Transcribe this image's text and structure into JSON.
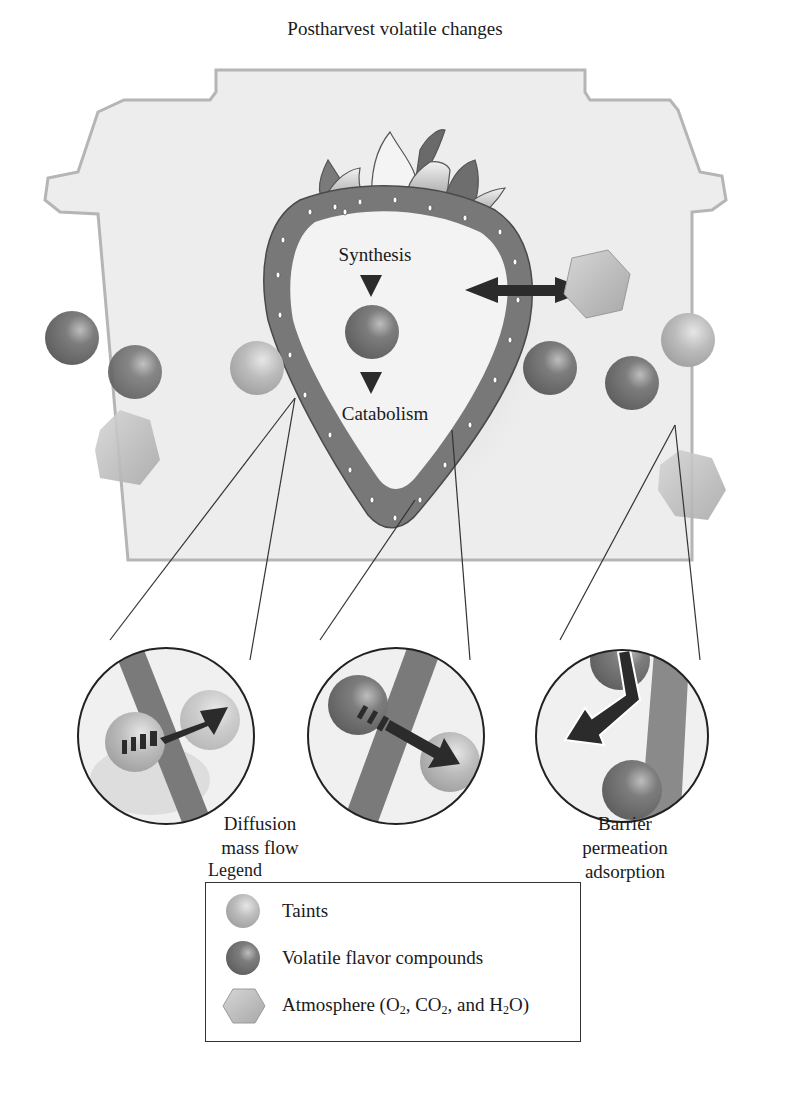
{
  "title": "Postharvest volatile changes",
  "fruit": {
    "top_label": "Synthesis",
    "bottom_label": "Catabolism"
  },
  "insets": [
    {
      "id": "diffusion",
      "label_lines": [
        "Diffusion",
        "mass flow"
      ]
    },
    {
      "id": "skin-crossing",
      "label_lines": []
    },
    {
      "id": "barrier",
      "label_lines": [
        "Barrier",
        "permeation",
        "adsorption"
      ]
    }
  ],
  "legend": {
    "title": "Legend",
    "items": [
      {
        "icon": "light-sphere-icon",
        "label": "Taints"
      },
      {
        "icon": "dark-sphere-icon",
        "label": "Volatile flavor compounds"
      },
      {
        "icon": "hexagon-icon",
        "label_parts": [
          "Atmosphere (O",
          "2",
          ", CO",
          "2",
          ", and H",
          "2",
          "O)"
        ]
      }
    ]
  },
  "colors": {
    "container_fill": "#eeeeee",
    "container_stroke": "#b8b8b8",
    "fruit_skin": "#7a7a7a",
    "fruit_flesh": "#f2f2f2",
    "dark_sphere": "#6e6e6e",
    "light_sphere": "#b5b5b5",
    "hexagon": "#bdbdbd",
    "arrow": "#2b2b2b"
  }
}
